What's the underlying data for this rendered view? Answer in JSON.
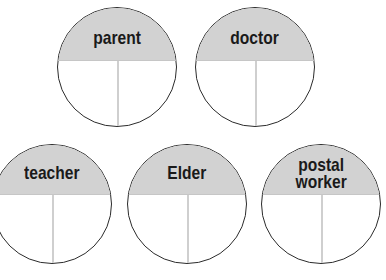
{
  "diagram": {
    "type": "labeled split circles",
    "circles": [
      {
        "label": "parent",
        "cx": 117,
        "cy": 67,
        "d": 120
      },
      {
        "label": "doctor",
        "cx": 255,
        "cy": 67,
        "d": 120
      },
      {
        "label": "teacher",
        "cx": 52,
        "cy": 204,
        "d": 120
      },
      {
        "label": "Elder",
        "cx": 187,
        "cy": 204,
        "d": 120
      },
      {
        "label": "postal\nworker",
        "cx": 321,
        "cy": 204,
        "d": 120
      }
    ],
    "colors": {
      "header_fill": "#d2d2d2",
      "outline": "#2b2b2b",
      "divider": "#cfcfcf",
      "body_fill": "#ffffff"
    }
  }
}
